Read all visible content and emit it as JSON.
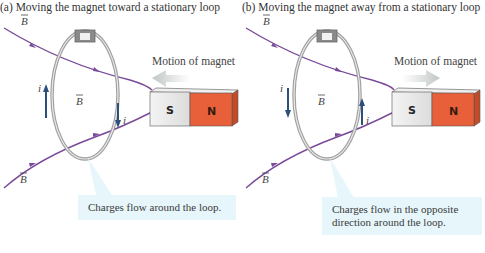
{
  "panels": [
    {
      "caption": "(a) Moving the magnet toward a stationary loop",
      "motion_label": "Motion of magnet",
      "motion_direction": "left",
      "current_direction_left": "up",
      "current_direction_right": "down",
      "callout": "Charges flow around the loop.",
      "field_symbol": "B",
      "current_symbol": "i",
      "magnet": {
        "south": "S",
        "north": "N"
      }
    },
    {
      "caption": "(b) Moving the magnet away from a stationary loop",
      "motion_label": "Motion of magnet",
      "motion_direction": "right",
      "current_direction_left": "down",
      "current_direction_right": "up",
      "callout": "Charges flow in the opposite direction around the loop.",
      "field_symbol": "B",
      "current_symbol": "i",
      "magnet": {
        "south": "S",
        "north": "N"
      }
    }
  ],
  "colors": {
    "field_line": "#7a4a9a",
    "loop": "#9a9a9a",
    "current_arrow": "#2d4f7c",
    "magnet_south": "#e6e6e6",
    "magnet_north": "#e8603a",
    "callout_bg": "#e6f6fa",
    "motion_arrow": "#c8cccc"
  }
}
